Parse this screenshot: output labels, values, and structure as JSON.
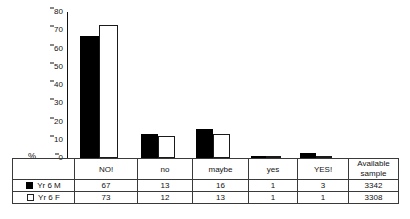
{
  "chart_data": {
    "type": "bar",
    "title": "",
    "xlabel": "",
    "ylabel": "%",
    "ylim": [
      0,
      80
    ],
    "ytick_step": 10,
    "yticks": [
      "80",
      "70",
      "60",
      "50",
      "40",
      "30",
      "20",
      "10",
      "0"
    ],
    "grid": false,
    "legend_position": "table-left",
    "categories": [
      "NO!",
      "no",
      "maybe",
      "yes",
      "YES!"
    ],
    "series": [
      {
        "name": "Yr 6 M",
        "swatch": "solid-black",
        "values": [
          67,
          13,
          16,
          1,
          3
        ],
        "available_sample": "3342"
      },
      {
        "name": "Yr 6 F",
        "swatch": "hollow-white",
        "values": [
          73,
          12,
          13,
          1,
          1
        ],
        "available_sample": "3308"
      }
    ],
    "extra_column_header": "Available sample"
  },
  "axis": {
    "percent_symbol": "%",
    "ticks": [
      {
        "label": "80",
        "value": 80
      },
      {
        "label": "70",
        "value": 70
      },
      {
        "label": "60",
        "value": 60
      },
      {
        "label": "50",
        "value": 50
      },
      {
        "label": "40",
        "value": 40
      },
      {
        "label": "30",
        "value": 30
      },
      {
        "label": "20",
        "value": 20
      },
      {
        "label": "10",
        "value": 10
      },
      {
        "label": "0",
        "value": 0
      }
    ]
  },
  "table": {
    "category_headers": [
      "NO!",
      "no",
      "maybe",
      "yes",
      "YES!"
    ],
    "sample_header_line1": "Available",
    "sample_header_line2": "sample",
    "rows": [
      {
        "legend": "Yr 6 M",
        "cells": [
          "67",
          "13",
          "16",
          "1",
          "3"
        ],
        "sample": "3342"
      },
      {
        "legend": "Yr 6 F",
        "cells": [
          "73",
          "12",
          "13",
          "1",
          "1"
        ],
        "sample": "3308"
      }
    ]
  },
  "colors": {
    "series_m": "#000000",
    "series_f": "#ffffff",
    "outline": "#1a1a1a",
    "axis": "#111111",
    "text": "#121212",
    "background": "#ffffff"
  }
}
